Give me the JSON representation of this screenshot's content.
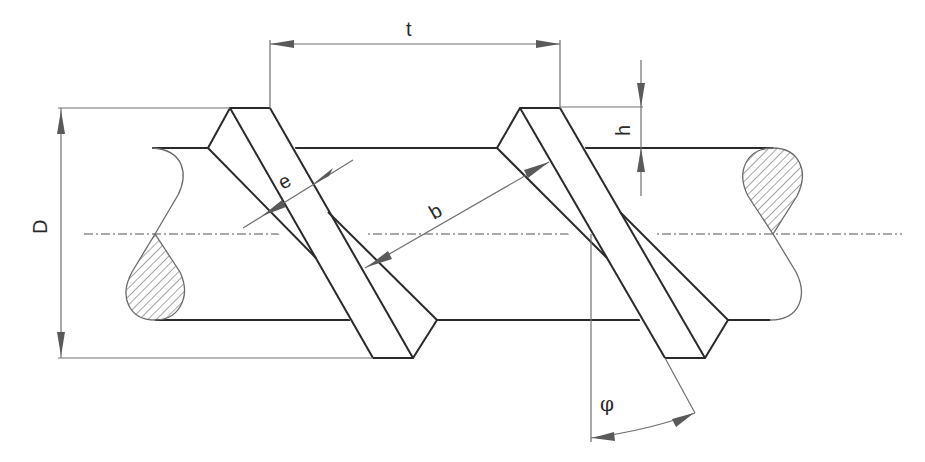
{
  "diagram": {
    "labels": {
      "pitch": "t",
      "rib_height": "h",
      "diameter": "D",
      "rib_top_width": "e",
      "rib_spacing": "b",
      "rib_angle": "φ"
    },
    "colors": {
      "outline": "#2a2a2a",
      "dimension": "#707070",
      "hatch": "#6a6a6a",
      "background": "#ffffff"
    }
  }
}
